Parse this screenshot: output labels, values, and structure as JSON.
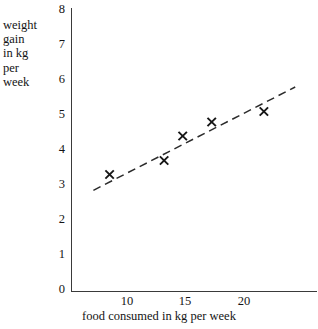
{
  "chart_data": {
    "type": "scatter",
    "title": "",
    "xlabel": "food consumed in kg per week",
    "ylabel": "weight gain in kg per week",
    "ylabel_lines": [
      "weight",
      "gain",
      "in kg",
      "per",
      "week"
    ],
    "xlim": [
      7,
      24.7
    ],
    "ylim": [
      0,
      8
    ],
    "xticks": [
      10,
      15,
      20
    ],
    "yticks": [
      0,
      1,
      2,
      3,
      4,
      5,
      6,
      7,
      8
    ],
    "xtick_labels": [
      "10",
      "15",
      "20"
    ],
    "ytick_labels": [
      "0",
      "1",
      "2",
      "3",
      "4",
      "5",
      "6",
      "7",
      "8"
    ],
    "grid": false,
    "legend": null,
    "marker": "x",
    "points": [
      {
        "x": 8.5,
        "y": 3.3
      },
      {
        "x": 13.2,
        "y": 3.7
      },
      {
        "x": 14.8,
        "y": 4.4
      },
      {
        "x": 17.3,
        "y": 4.8
      },
      {
        "x": 21.8,
        "y": 5.1
      }
    ],
    "series": [
      {
        "name": "observations",
        "x": [
          8.5,
          13.2,
          14.8,
          17.3,
          21.8
        ],
        "values": [
          3.3,
          3.7,
          4.4,
          4.8,
          5.1
        ]
      }
    ],
    "trendline": {
      "style": "dashed",
      "x_start": 7.1,
      "y_start": 2.85,
      "x_end": 24.5,
      "y_end": 5.8
    }
  }
}
